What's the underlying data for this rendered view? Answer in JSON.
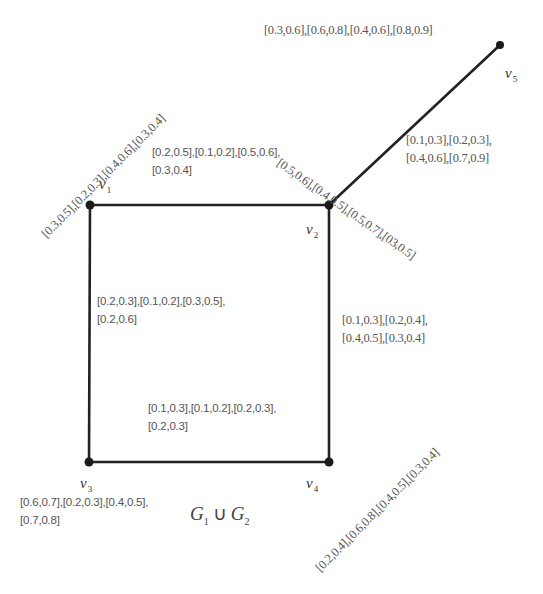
{
  "graph": {
    "title": {
      "left": "G",
      "left_sub": "1",
      "operator": "∪",
      "right": "G",
      "right_sub": "2"
    },
    "vertices": [
      {
        "id": "v1",
        "name": "v",
        "sub": "1",
        "x": 90,
        "y": 205
      },
      {
        "id": "v2",
        "name": "v",
        "sub": "2",
        "x": 329,
        "y": 205
      },
      {
        "id": "v3",
        "name": "v",
        "sub": "3",
        "x": 89,
        "y": 462
      },
      {
        "id": "v4",
        "name": "v",
        "sub": "4",
        "x": 329,
        "y": 462
      },
      {
        "id": "v5",
        "name": "v",
        "sub": "5",
        "x": 500,
        "y": 45
      }
    ],
    "edges": [
      {
        "from": "v1",
        "to": "v2"
      },
      {
        "from": "v1",
        "to": "v3"
      },
      {
        "from": "v2",
        "to": "v4"
      },
      {
        "from": "v3",
        "to": "v4"
      },
      {
        "from": "v2",
        "to": "v5"
      }
    ],
    "vertex_labels": {
      "v1": "[0.3,0.5],[0.2,0.3],[0.4,0.6],[0.3,0.4]",
      "v2": "[0.5,0.6],[0.4,0.5],[0.5,0.7],[03,0.5]",
      "v3_line1": "[0.6,0.7],[0.2,0.3],[0.4,0.5],",
      "v3_line2": "[0.7,0.8]",
      "v4": "[0.2,0.4],[0.6,0.8],[0.4,0.5],[0.3,0.4]",
      "v5": "[0.3,0.6],[0.6,0.8],[0.4,0.6],[0.8,0.9]"
    },
    "edge_labels": {
      "v1_v2_line1": "[0.2,0.5],[0.1,0.2],[0.5,0.6],",
      "v1_v2_line2": "[0.3,0.4]",
      "v1_v3_line1": "[0.2,0.3],[0.1,0.2],[0.3,0.5],",
      "v1_v3_line2": "[0.2,0.6]",
      "v2_v4_line1": "[0.1,0.3],[0.2,0.4],",
      "v2_v4_line2": "[0.4,0.5],[0.3,0.4]",
      "v3_v4_line1": "[0.1,0.3],[0.1,0.2],[0.2,0.3],",
      "v3_v4_line2": "[0.2,0.3]",
      "v2_v5_line1": "[0.1,0.3],[0.2,0.3],",
      "v2_v5_line2": "[0.4,0.6],[0.7,0.9]"
    },
    "colors": {
      "edge": "#222222",
      "vertex": "#1a1a1a",
      "label": "#555555"
    }
  }
}
